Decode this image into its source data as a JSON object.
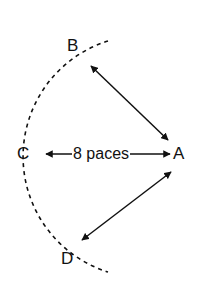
{
  "diagram": {
    "type": "positions-on-arc",
    "points": [
      {
        "id": "A",
        "label": "A"
      },
      {
        "id": "B",
        "label": "B"
      },
      {
        "id": "C",
        "label": "C"
      },
      {
        "id": "D",
        "label": "D"
      }
    ],
    "distance_label": "8 paces",
    "connections": [
      {
        "from": "A",
        "to": "B",
        "style": "double-arrow"
      },
      {
        "from": "A",
        "to": "C",
        "style": "double-arrow",
        "label": "8 paces"
      },
      {
        "from": "A",
        "to": "D",
        "style": "double-arrow"
      }
    ],
    "arc": {
      "style": "dashed",
      "through": [
        "B",
        "C",
        "D"
      ]
    },
    "colors": {
      "ink": "#111111",
      "background": "#ffffff"
    }
  }
}
